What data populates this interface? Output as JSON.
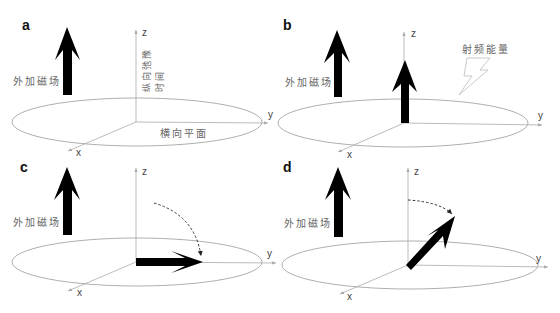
{
  "figure": {
    "panels": [
      {
        "id": "a",
        "label": "a",
        "field_label": "外加磁场",
        "axes": {
          "z": "z",
          "y": "y",
          "x": "x"
        },
        "annotations": {
          "vertical_text_line1": "纵向弛豫",
          "vertical_text_line2": "时间",
          "plane_label": "横向平面"
        }
      },
      {
        "id": "b",
        "label": "b",
        "field_label": "外加磁场",
        "axes": {
          "z": "z",
          "y": "y",
          "x": "x"
        },
        "annotations": {
          "rf_label": "射频能量"
        }
      },
      {
        "id": "c",
        "label": "c",
        "field_label": "外加磁场",
        "axes": {
          "z": "z",
          "y": "y",
          "x": "x"
        }
      },
      {
        "id": "d",
        "label": "d",
        "field_label": "外加磁场",
        "axes": {
          "z": "z",
          "y": "y",
          "x": "x"
        }
      }
    ],
    "colors": {
      "arrow": "#000000",
      "axis": "#aaaaaa",
      "ellipse": "#999999",
      "text": "#666666"
    }
  }
}
